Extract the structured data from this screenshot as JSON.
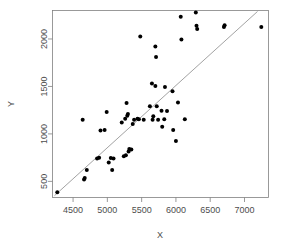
{
  "chart_data": {
    "type": "scatter",
    "title": "",
    "xlabel": "X",
    "ylabel": "Y",
    "xlim": [
      4200,
      7350
    ],
    "ylim": [
      330,
      2300
    ],
    "xticks": [
      4500,
      5000,
      5500,
      6000,
      6500,
      7000
    ],
    "yticks": [
      500,
      1000,
      1500,
      2000
    ],
    "xtick_labels": [
      "4500",
      "5000",
      "5500",
      "6000",
      "6500",
      "7000"
    ],
    "ytick_labels": [
      "500",
      "1000",
      "1500",
      "2000"
    ],
    "grid": false,
    "legend": null,
    "point_color": "#000000",
    "line_color": "#8a8a8a",
    "frame_color": "#808080",
    "text_color": "#4d4d4d",
    "reference_line": {
      "type": "identity-diagonal",
      "x_start": 4230,
      "y_start": 350,
      "x_end": 7190,
      "y_end": 2290
    },
    "points": [
      {
        "x": 4270,
        "y": 385
      },
      {
        "x": 4640,
        "y": 1150
      },
      {
        "x": 4660,
        "y": 520
      },
      {
        "x": 4670,
        "y": 535
      },
      {
        "x": 4700,
        "y": 620
      },
      {
        "x": 4850,
        "y": 740
      },
      {
        "x": 4880,
        "y": 750
      },
      {
        "x": 4900,
        "y": 1035
      },
      {
        "x": 4960,
        "y": 1040
      },
      {
        "x": 4990,
        "y": 1230
      },
      {
        "x": 5020,
        "y": 700
      },
      {
        "x": 5050,
        "y": 745
      },
      {
        "x": 5070,
        "y": 620
      },
      {
        "x": 5090,
        "y": 740
      },
      {
        "x": 5210,
        "y": 1120
      },
      {
        "x": 5240,
        "y": 765
      },
      {
        "x": 5260,
        "y": 1160
      },
      {
        "x": 5270,
        "y": 775
      },
      {
        "x": 5280,
        "y": 1325
      },
      {
        "x": 5290,
        "y": 1190
      },
      {
        "x": 5300,
        "y": 1210
      },
      {
        "x": 5310,
        "y": 815
      },
      {
        "x": 5320,
        "y": 840
      },
      {
        "x": 5350,
        "y": 835
      },
      {
        "x": 5370,
        "y": 1105
      },
      {
        "x": 5390,
        "y": 1150
      },
      {
        "x": 5440,
        "y": 1160
      },
      {
        "x": 5460,
        "y": 1155
      },
      {
        "x": 5480,
        "y": 2025
      },
      {
        "x": 5530,
        "y": 1150
      },
      {
        "x": 5620,
        "y": 1290
      },
      {
        "x": 5650,
        "y": 1530
      },
      {
        "x": 5660,
        "y": 1150
      },
      {
        "x": 5670,
        "y": 1185
      },
      {
        "x": 5700,
        "y": 1920
      },
      {
        "x": 5700,
        "y": 1505
      },
      {
        "x": 5710,
        "y": 1810
      },
      {
        "x": 5720,
        "y": 1290
      },
      {
        "x": 5740,
        "y": 1150
      },
      {
        "x": 5790,
        "y": 1245
      },
      {
        "x": 5800,
        "y": 1075
      },
      {
        "x": 5830,
        "y": 1155
      },
      {
        "x": 5840,
        "y": 1495
      },
      {
        "x": 5870,
        "y": 1240
      },
      {
        "x": 5950,
        "y": 1450
      },
      {
        "x": 5960,
        "y": 1040
      },
      {
        "x": 6000,
        "y": 925
      },
      {
        "x": 6030,
        "y": 1330
      },
      {
        "x": 6070,
        "y": 2235
      },
      {
        "x": 6080,
        "y": 1995
      },
      {
        "x": 6130,
        "y": 1155
      },
      {
        "x": 6290,
        "y": 2280
      },
      {
        "x": 6300,
        "y": 2140
      },
      {
        "x": 6310,
        "y": 2105
      },
      {
        "x": 6700,
        "y": 2125
      },
      {
        "x": 6710,
        "y": 2145
      },
      {
        "x": 7245,
        "y": 2125
      }
    ]
  },
  "axes": {
    "x_title": "X",
    "y_title": "Y"
  }
}
